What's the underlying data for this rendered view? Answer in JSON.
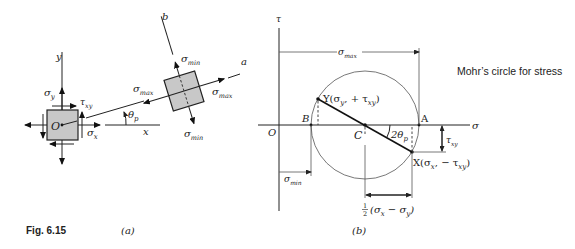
{
  "figure": {
    "caption": "Fig. 6.15",
    "title_note": "Mohr’s circle for stress",
    "panel_a": {
      "label": "(a)",
      "axes": {
        "y": "y",
        "x": "x",
        "a": "a",
        "b": "b",
        "origin": "O"
      },
      "element_labels": {
        "sigma_y": "σ",
        "sigma_y_sub": "y",
        "tau_xy": "τ",
        "tau_xy_sub": "xy",
        "sigma_x": "σ",
        "sigma_x_sub": "x"
      },
      "angle_label": "θ",
      "angle_sub": "p",
      "rotated_element_labels": {
        "sigma_min": "σ",
        "min_sub": "min",
        "sigma_max": "σ",
        "max_sub": "max"
      }
    },
    "panel_b": {
      "label": "(b)",
      "axes": {
        "tau": "τ",
        "sigma": "σ",
        "origin": "O"
      },
      "points": {
        "A": "A",
        "B": "B",
        "C": "C",
        "Y": "Y(σ",
        "Y_mid": ", + τ",
        "Y_end": ")",
        "X": "X(σ",
        "X_mid": ", − τ",
        "X_end": ")"
      },
      "subs": {
        "x": "x",
        "y": "y",
        "xy": "xy"
      },
      "angle_label": "2θ",
      "angle_sub": "p",
      "dimensions": {
        "sigma_max": "σ",
        "max_sub": "max",
        "sigma_min": "σ",
        "min_sub": "min",
        "tau_xy": "τ",
        "tau_sub": "xy",
        "half_num": "1",
        "half_den": "2",
        "half_expr": "(σ",
        "half_mid": " − σ",
        "half_end": ")"
      }
    }
  }
}
